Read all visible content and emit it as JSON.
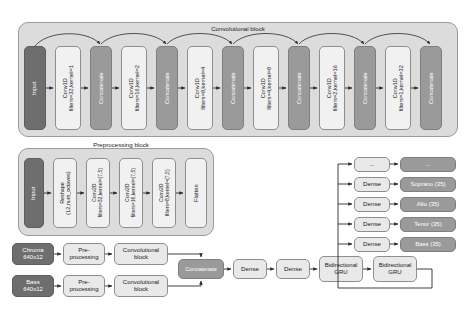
{
  "figure": {
    "conv_block": {
      "title": "Convolutional block",
      "input_label": "Input",
      "concat_label": "Concatenate",
      "layers": [
        "Conv1D\nfilters=32,kernel=1",
        "Conv1D\nfilters=16,kernel=2",
        "Conv1D\nfilters=8,kernel=4",
        "Conv1D\nfilters=4,kernel=8",
        "Conv1D\nfilters=2,kernel=16",
        "Conv1D\nfilters=1,kernel=32"
      ]
    },
    "preproc_block": {
      "title": "Preprocessing block",
      "input_label": "Input",
      "reshape_label": "Reshape\n(12,num_octaves)",
      "conv2d": [
        "Conv2D\nfilters=32,kernel=(7,5)",
        "Conv2D\nfilters=16,kernel=(7,5)",
        "Conv2D\nfilters=8,kernel=(7,5)"
      ],
      "flatten_label": "Flatten"
    },
    "streams": [
      {
        "input": "Chroma\n640x12",
        "preprocessing": "Pre-\nprocessing",
        "conv": "Convolutional\nblock"
      },
      {
        "input": "Bass\n640x12",
        "preprocessing": "Pre-\nprocessing",
        "conv": "Convolutional\nblock"
      }
    ],
    "trunk": {
      "concatenate": "Concatenate",
      "dense_1": "Dense",
      "dense_2": "Dense",
      "gru_1": "Bidirectional\nGRU",
      "gru_2": "Bidirectional\nGRU"
    },
    "heads": [
      {
        "dense": "...",
        "output": "..."
      },
      {
        "dense": "Dense",
        "output": "Soprano (35)"
      },
      {
        "dense": "Dense",
        "output": "Alto (35)"
      },
      {
        "dense": "Dense",
        "output": "Tenor (35)"
      },
      {
        "dense": "Dense",
        "output": "Bass (35)"
      }
    ]
  },
  "colors": {
    "group_bg": "#dcdcdc",
    "dark_node": "#6e6e6e",
    "mid_node": "#9a9a9a",
    "light_node": "#e9e9e9",
    "arrow": "#2b2b2b"
  }
}
